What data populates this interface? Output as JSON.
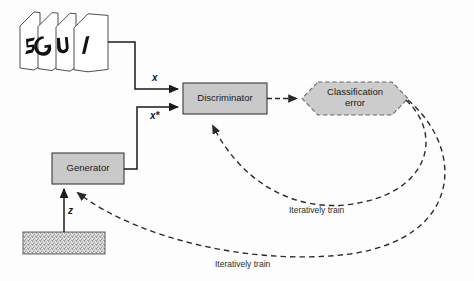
{
  "diagram": {
    "nodes": {
      "real_images": {
        "name": "real-image-stack",
        "caption": "",
        "glyphs": [
          "5",
          "6",
          "4",
          "1"
        ]
      },
      "discriminator": {
        "label": "Discriminator",
        "fill": "#c9c9c9",
        "stroke": "#3a3a3a"
      },
      "generator": {
        "label": "Generator",
        "fill": "#c9c9c9",
        "stroke": "#3a3a3a"
      },
      "classification_error": {
        "label_line1": "Classification",
        "label_line2": "error",
        "fill": "#c9c9c9",
        "stroke": "#6b6b6b"
      },
      "noise": {
        "label": "z",
        "fill": "#d8d8d8",
        "stroke": "#555555"
      }
    },
    "edges": {
      "real_to_disc": {
        "label": "x"
      },
      "gen_to_disc": {
        "label": "x*"
      },
      "disc_to_error": {
        "label": ""
      },
      "error_to_disc": {
        "label": "Iteratively train"
      },
      "error_to_gen": {
        "label": "Iteratively train"
      },
      "noise_to_gen": {
        "label": "z"
      }
    },
    "colors": {
      "line": "#1a1a1a",
      "dashed": "#2a2a2a",
      "box_fill": "#c9c9c9",
      "hex_fill": "#cccccc",
      "background": "#fdfdfd"
    }
  }
}
